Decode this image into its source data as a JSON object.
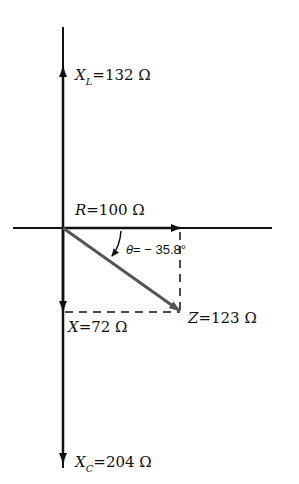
{
  "diagram": {
    "type": "impedance phasor diagram",
    "colors": {
      "axis": "#111111",
      "impedance_vector": "#555555",
      "background": "#ffffff"
    },
    "labels": {
      "xl": {
        "var": "X",
        "sub": "L",
        "value": "=132 Ω"
      },
      "r": {
        "var": "R",
        "value": "=100 Ω"
      },
      "theta": {
        "var": "θ",
        "value": "= − 35.8°"
      },
      "x": {
        "var": "X",
        "value": "=72 Ω"
      },
      "z": {
        "var": "Z",
        "value": "=123 Ω"
      },
      "xc": {
        "var": "X",
        "sub": "C",
        "value": "=204 Ω"
      }
    },
    "quantities": {
      "R_ohm": 100,
      "XL_ohm": 132,
      "XC_ohm": 204,
      "X_ohm": 72,
      "Z_ohm": 123,
      "theta_deg": -35.8
    }
  }
}
